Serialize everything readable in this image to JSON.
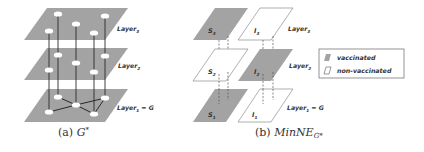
{
  "figure": {
    "panels": [
      {
        "id": "a",
        "caption_prefix": "(a)",
        "caption_math": "G",
        "caption_sup": "*",
        "layers": [
          {
            "name": "Layer",
            "sub": "3",
            "suffix": ""
          },
          {
            "name": "Layer",
            "sub": "2",
            "suffix": ""
          },
          {
            "name": "Layer",
            "sub": "1",
            "suffix": " = G"
          }
        ]
      },
      {
        "id": "b",
        "caption_prefix": "(b)",
        "caption_math": "MinNE",
        "caption_sub": "G*",
        "layers": [
          {
            "name": "Layer",
            "sub": "3",
            "suffix": ""
          },
          {
            "name": "Layer",
            "sub": "2",
            "suffix": ""
          },
          {
            "name": "Layer",
            "sub": "1",
            "suffix": " = G"
          }
        ],
        "cells": [
          {
            "row": 3,
            "column": "S",
            "label": "S",
            "sub": "3",
            "status": "vaccinated"
          },
          {
            "row": 3,
            "column": "I",
            "label": "I",
            "sub": "3",
            "status": "non-vaccinated"
          },
          {
            "row": 2,
            "column": "S",
            "label": "S",
            "sub": "2",
            "status": "non-vaccinated"
          },
          {
            "row": 2,
            "column": "I",
            "label": "I",
            "sub": "2",
            "status": "vaccinated"
          },
          {
            "row": 1,
            "column": "S",
            "label": "S",
            "sub": "1",
            "status": "vaccinated"
          },
          {
            "row": 1,
            "column": "I",
            "label": "I",
            "sub": "1",
            "status": "non-vaccinated"
          }
        ],
        "legend": {
          "items": [
            {
              "label": "vaccinated",
              "swatch": "filled"
            },
            {
              "label": "non-vaccinated",
              "swatch": "empty"
            }
          ]
        }
      }
    ],
    "colors": {
      "plane_fill": "#a3a3a3",
      "plane_empty": "#ffffff",
      "node_fill": "#ffffff",
      "edge": "#2a2a2a",
      "text": "#333333"
    }
  }
}
